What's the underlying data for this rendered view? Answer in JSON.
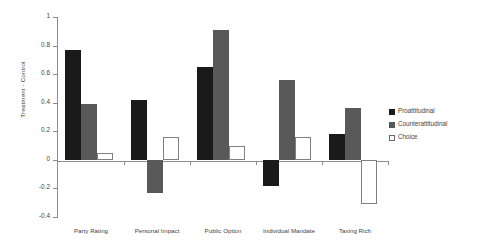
{
  "chart_data": {
    "type": "bar",
    "title": "",
    "xlabel": "",
    "ylabel": "Treatment - Control",
    "ylim": [
      -0.4,
      1
    ],
    "yticks": [
      "1",
      "0.8",
      "0.6",
      "0.4",
      "0.2",
      "0",
      "-0.2",
      "-0.4"
    ],
    "ytick_values": [
      1,
      0.8,
      0.6,
      0.4,
      0.2,
      0,
      -0.2,
      -0.4
    ],
    "grid": false,
    "legend_position": "right",
    "categories": [
      "Party Rating",
      "Personal Impact",
      "Public Option",
      "Individual Mandate",
      "Taxing Rich"
    ],
    "series": [
      {
        "name": "Proattitudinal",
        "color": "#1a1a1a",
        "values": [
          0.77,
          0.42,
          0.65,
          -0.18,
          0.18
        ]
      },
      {
        "name": "Counterattitudinal",
        "color": "#595959",
        "values": [
          0.39,
          -0.23,
          0.91,
          0.56,
          0.36
        ]
      },
      {
        "name": "Choice",
        "color": "#ffffff",
        "values": [
          0.05,
          0.16,
          0.1,
          0.16,
          -0.31
        ]
      }
    ]
  },
  "axis": {
    "y_title": "Treatment - Control"
  },
  "colors": {
    "proattitudinal": "#1a1a1a",
    "counterattitudinal": "#595959",
    "choice": "#ffffff",
    "axis": "#8c8c8c",
    "text": "#3f3f3f",
    "background": "#ffffff"
  }
}
